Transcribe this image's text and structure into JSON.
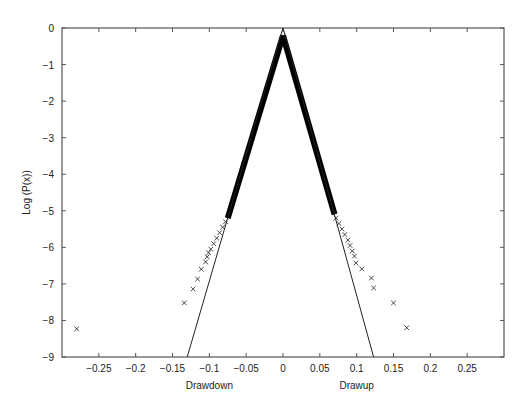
{
  "chart_data": {
    "type": "scatter",
    "title": "",
    "xlabel_left": "Drawdown",
    "xlabel_right": "Drawup",
    "ylabel": "Log (P(x))",
    "xlim": [
      -0.3,
      0.3
    ],
    "ylim": [
      -9,
      0
    ],
    "grid": false,
    "legend": null,
    "x_ticks": [
      -0.25,
      -0.2,
      -0.15,
      -0.1,
      -0.05,
      0,
      0.05,
      0.1,
      0.15,
      0.2,
      0.25
    ],
    "x_tick_labels": [
      "-0.25",
      "-0.2",
      "-0.15",
      "-0.1",
      "-0.05",
      "0",
      "0.05",
      "0.1",
      "0.15",
      "0.2",
      "0.25"
    ],
    "y_ticks": [
      0,
      -1,
      -2,
      -3,
      -4,
      -5,
      -6,
      -7,
      -8,
      -9
    ],
    "y_tick_labels": [
      "0",
      "-1",
      "-2",
      "-3",
      "-4",
      "-5",
      "-6",
      "-7",
      "-8",
      "-9"
    ],
    "series": [
      {
        "name": "Drawdown empirical (dense band)",
        "style": "dense-x-markers",
        "points": [
          [
            0,
            -0.2
          ],
          [
            -0.075,
            -5.2
          ]
        ]
      },
      {
        "name": "Drawup empirical (dense band)",
        "style": "dense-x-markers",
        "points": [
          [
            0,
            -0.2
          ],
          [
            0.07,
            -5.1
          ]
        ]
      },
      {
        "name": "Drawdown empirical (tail)",
        "style": "x-markers",
        "points": [
          [
            -0.078,
            -5.3
          ],
          [
            -0.082,
            -5.45
          ],
          [
            -0.086,
            -5.6
          ],
          [
            -0.09,
            -5.75
          ],
          [
            -0.094,
            -5.9
          ],
          [
            -0.098,
            -6.05
          ],
          [
            -0.101,
            -6.15
          ],
          [
            -0.103,
            -6.26
          ],
          [
            -0.105,
            -6.4
          ],
          [
            -0.111,
            -6.6
          ],
          [
            -0.116,
            -6.87
          ],
          [
            -0.122,
            -7.14
          ],
          [
            -0.134,
            -7.52
          ],
          [
            -0.28,
            -8.23
          ]
        ]
      },
      {
        "name": "Drawup empirical (tail)",
        "style": "x-markers",
        "points": [
          [
            0.072,
            -5.2
          ],
          [
            0.076,
            -5.35
          ],
          [
            0.08,
            -5.5
          ],
          [
            0.084,
            -5.65
          ],
          [
            0.088,
            -5.8
          ],
          [
            0.091,
            -5.95
          ],
          [
            0.094,
            -6.1
          ],
          [
            0.097,
            -6.24
          ],
          [
            0.099,
            -6.43
          ],
          [
            0.107,
            -6.59
          ],
          [
            0.12,
            -6.84
          ],
          [
            0.123,
            -7.11
          ],
          [
            0.15,
            -7.52
          ],
          [
            0.168,
            -8.2
          ]
        ]
      },
      {
        "name": "Drawdown fit",
        "style": "line",
        "points": [
          [
            0,
            0
          ],
          [
            -0.13,
            -9
          ]
        ]
      },
      {
        "name": "Drawup fit",
        "style": "line",
        "points": [
          [
            0,
            0
          ],
          [
            0.123,
            -9
          ]
        ]
      }
    ]
  },
  "plot_area": {
    "left": 62,
    "right": 504,
    "top": 28,
    "bottom": 357
  }
}
